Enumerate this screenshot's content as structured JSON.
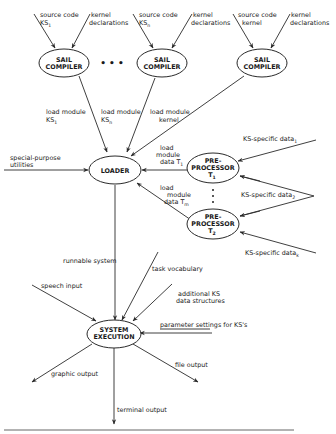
{
  "diagram": {
    "nodes": {
      "sail1": {
        "line1": "SAIL",
        "line2": "COMPILER"
      },
      "sailn": {
        "line1": "SAIL",
        "line2": "COMPILER"
      },
      "sailk": {
        "line1": "SAIL",
        "line2": "COMPILER"
      },
      "loader": {
        "line1": "LOADER"
      },
      "pre1": {
        "line1": "PRE-",
        "line2": "PROCESSOR",
        "line3": "T",
        "sub": "1"
      },
      "pre2": {
        "line1": "PRE-",
        "line2": "PROCESSOR",
        "line3": "T",
        "sub": "2"
      },
      "sysexec": {
        "line1": "SYSTEM",
        "line2": "EXECUTION"
      }
    },
    "ellipsis_h": "• • •",
    "labels": {
      "src1_a": "source code",
      "src1_b": "KS",
      "src1_sub": "1",
      "kern1_a": "kernel",
      "kern1_b": "declarations",
      "srcn_a": "source code",
      "srcn_b": "KS",
      "srcn_sub": "n",
      "kernn_a": "kernel",
      "kernn_b": "declarations",
      "srck_a": "source code",
      "srck_b": "kernel",
      "kernk_a": "kernel",
      "kernk_b": "declarations",
      "lm1_a": "load module",
      "lm1_b": "KS",
      "lm1_sub": "1",
      "lmn_a": "load module",
      "lmn_b": "KS",
      "lmn_sub": "n",
      "lmk_a": "load module",
      "lmk_b": "kernel",
      "spu_a": "special-purpose",
      "spu_b": "utilities",
      "lmd1_a": "load",
      "lmd1_b": "module",
      "lmd1_c": "data  T",
      "lmd1_sub": "1",
      "lmdm_a": "load",
      "lmdm_b": "module",
      "lmdm_c": "data  T",
      "lmdm_sub": "m",
      "ksd1": "KS-specific data",
      "ksd1_sub": "1",
      "ksd2": "KS-specific data",
      "ksd2_sub": "2",
      "ksdk": "KS-specific data",
      "ksdk_sub": "k",
      "runnable": "runnable system",
      "taskvocab": "task vocabulary",
      "addks_a": "additional KS",
      "addks_b": "data structures",
      "speech": "speech input",
      "params": "parameter settings for KS's",
      "graphic": "graphic output",
      "file": "file output",
      "terminal": "terminal output"
    }
  }
}
